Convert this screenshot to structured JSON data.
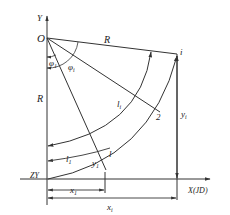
{
  "diagram": {
    "labels": {
      "y_axis": "Y",
      "origin": "O",
      "radius_top": "R",
      "radius_left": "R",
      "phi_1": "φ",
      "phi_1_sub": "1",
      "phi_i": "φ",
      "phi_i_sub": "i",
      "point_i": "i",
      "point_2": "2",
      "arc_li": "l",
      "arc_li_sub": "i",
      "arc_l1": "l",
      "arc_l1_sub": "1",
      "point_l": "l",
      "y_1": "y",
      "y_1_sub": "1",
      "y_i": "y",
      "y_i_sub": "i",
      "zy": "ZY",
      "x_axis": "X(JD)",
      "x_1": "x",
      "x_1_sub": "1",
      "x_i": "x",
      "x_i_sub": "i"
    },
    "stroke_color": "#333333"
  }
}
